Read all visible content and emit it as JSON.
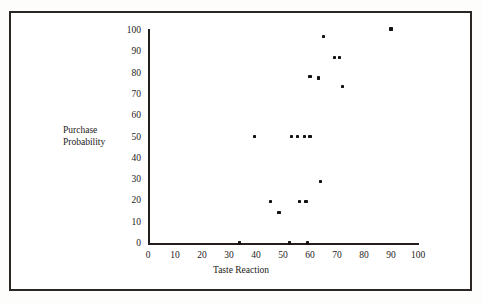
{
  "chart_data": {
    "type": "scatter",
    "title": "",
    "xlabel": "Taste Reaction",
    "ylabel": "Purchase Probability",
    "ylabel_line1": "Purchase",
    "ylabel_line2": "Probability",
    "xlim": [
      0,
      100
    ],
    "ylim": [
      0,
      100
    ],
    "xticks": [
      0,
      10,
      20,
      30,
      40,
      50,
      60,
      70,
      80,
      90,
      100
    ],
    "xtick_labels": [
      "0",
      "10",
      "20",
      "30",
      "40",
      "50",
      "60",
      "70",
      "80",
      "90",
      "100"
    ],
    "yticks": [
      0,
      10,
      20,
      30,
      40,
      50,
      60,
      70,
      80,
      90,
      100
    ],
    "ytick_labels": [
      "0",
      "10",
      "20",
      "30",
      "40",
      "50",
      "60",
      "70",
      "80",
      "90",
      "100"
    ],
    "grid": false,
    "legend": false,
    "marker": "square",
    "marker_color": "#16120f",
    "points": [
      {
        "x": 34,
        "y": 0
      },
      {
        "x": 52.5,
        "y": 0
      },
      {
        "x": 59,
        "y": 0
      },
      {
        "x": 48.5,
        "y": 14.5
      },
      {
        "x": 45.5,
        "y": 19.5
      },
      {
        "x": 56,
        "y": 19.5
      },
      {
        "x": 58.5,
        "y": 19.5
      },
      {
        "x": 64,
        "y": 29
      },
      {
        "x": 39.5,
        "y": 50
      },
      {
        "x": 53,
        "y": 50
      },
      {
        "x": 55.5,
        "y": 50
      },
      {
        "x": 58,
        "y": 50
      },
      {
        "x": 60,
        "y": 50
      },
      {
        "x": 72,
        "y": 73.5
      },
      {
        "x": 63,
        "y": 77.5
      },
      {
        "x": 60,
        "y": 78
      },
      {
        "x": 69,
        "y": 87
      },
      {
        "x": 71,
        "y": 87
      },
      {
        "x": 65,
        "y": 97
      },
      {
        "x": 90,
        "y": 100.5
      }
    ]
  },
  "colors": {
    "frame": "#2a2724",
    "axis": "#241f1c",
    "text": "#1d1a18",
    "marker": "#16120f",
    "background": "#ffffff"
  }
}
